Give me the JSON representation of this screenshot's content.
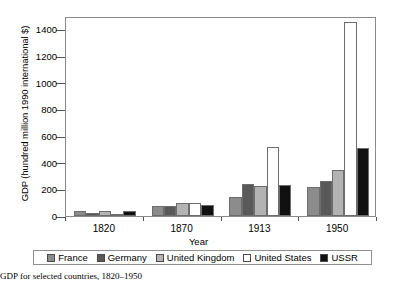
{
  "chart_data": {
    "type": "bar",
    "title": "",
    "xlabel": "Year",
    "ylabel": "GDP (hundred million 1990 international $)",
    "categories": [
      "1820",
      "1870",
      "1913",
      "1950"
    ],
    "ylim": [
      0,
      1500
    ],
    "yticks": [
      0,
      200,
      400,
      600,
      800,
      1000,
      1200,
      1400
    ],
    "ytick_labels": [
      "0",
      "200",
      "400",
      "600",
      "800",
      "1000",
      "1200",
      "1400"
    ],
    "grid": false,
    "legend_position": "bottom",
    "series": [
      {
        "name": "France",
        "color": "#8c8c8c",
        "values": [
          35,
          72,
          145,
          220
        ]
      },
      {
        "name": "Germany",
        "color": "#595959",
        "values": [
          26,
          72,
          237,
          265
        ]
      },
      {
        "name": "United Kingdom",
        "color": "#b3b3b3",
        "values": [
          36,
          100,
          225,
          348
        ]
      },
      {
        "name": "United States",
        "color": "#ffffff",
        "values": [
          13,
          98,
          517,
          1456
        ]
      },
      {
        "name": "USSR",
        "color": "#111111",
        "values": [
          37,
          83,
          232,
          510
        ]
      }
    ]
  },
  "caption": {
    "number": "",
    "text": "GDP for selected countries, 1820–1950"
  }
}
